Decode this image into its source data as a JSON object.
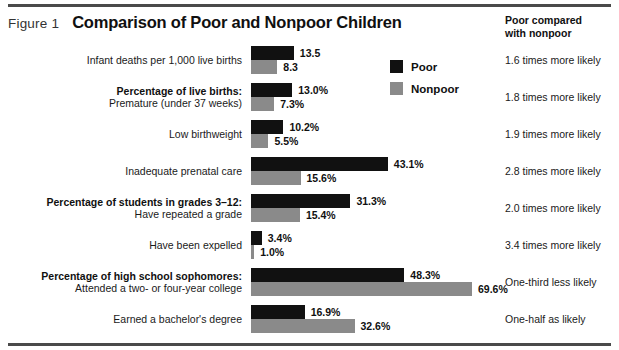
{
  "figure": {
    "number_label": "Figure 1",
    "title": "Comparison of Poor and Nonpoor Children",
    "right_column_header_line1": "Poor compared",
    "right_column_header_line2": "with nonpoor"
  },
  "legend": {
    "items": [
      {
        "label": "Poor",
        "color": "#111111"
      },
      {
        "label": "Nonpoor",
        "color": "#8a8a8a"
      }
    ]
  },
  "chart_data": {
    "type": "bar",
    "title": "Comparison of Poor and Nonpoor Children",
    "xlabel": "",
    "ylabel": "",
    "orientation": "horizontal",
    "grid": false,
    "legend_position": "top-right",
    "xlim": [
      0,
      72
    ],
    "series": [
      {
        "name": "Poor",
        "color": "#111111",
        "values": [
          13.5,
          13.0,
          10.2,
          43.1,
          31.3,
          3.4,
          48.3,
          16.9
        ]
      },
      {
        "name": "Nonpoor",
        "color": "#8a8a8a",
        "values": [
          8.3,
          7.3,
          5.5,
          15.6,
          15.4,
          1.0,
          69.6,
          32.6
        ]
      }
    ],
    "categories": [
      "Infant deaths per 1,000 live births",
      "Premature (under 37 weeks)",
      "Low birthweight",
      "Inadequate prenatal care",
      "Have repeated a grade",
      "Have been expelled",
      "Attended a two- or four-year college",
      "Earned a bachelor's degree"
    ],
    "group_headings": [
      "Percentage of live births:",
      "Percentage of students in grades 3–12:",
      "Percentage of high school sophomores:"
    ],
    "rows": [
      {
        "heading": "",
        "label": "Infant deaths per 1,000 live births",
        "poor_value": 13.5,
        "nonpoor_value": 8.3,
        "poor_label": "13.5",
        "nonpoor_label": "8.3",
        "comparison": "1.6 times more likely"
      },
      {
        "heading": "Percentage of live births:",
        "label": "Premature (under 37 weeks)",
        "poor_value": 13.0,
        "nonpoor_value": 7.3,
        "poor_label": "13.0%",
        "nonpoor_label": "7.3%",
        "comparison": "1.8 times more likely"
      },
      {
        "heading": "",
        "label": "Low birthweight",
        "poor_value": 10.2,
        "nonpoor_value": 5.5,
        "poor_label": "10.2%",
        "nonpoor_label": "5.5%",
        "comparison": "1.9 times more likely"
      },
      {
        "heading": "",
        "label": "Inadequate prenatal care",
        "poor_value": 43.1,
        "nonpoor_value": 15.6,
        "poor_label": "43.1%",
        "nonpoor_label": "15.6%",
        "comparison": "2.8 times more likely"
      },
      {
        "heading": "Percentage of students in grades 3–12:",
        "label": "Have repeated a grade",
        "poor_value": 31.3,
        "nonpoor_value": 15.4,
        "poor_label": "31.3%",
        "nonpoor_label": "15.4%",
        "comparison": "2.0 times more likely"
      },
      {
        "heading": "",
        "label": "Have been expelled",
        "poor_value": 3.4,
        "nonpoor_value": 1.0,
        "poor_label": "3.4%",
        "nonpoor_label": "1.0%",
        "comparison": "3.4 times more likely"
      },
      {
        "heading": "Percentage of high school sophomores:",
        "label": "Attended a two- or four-year college",
        "poor_value": 48.3,
        "nonpoor_value": 69.6,
        "poor_label": "48.3%",
        "nonpoor_label": "69.6%",
        "comparison": "One-third less likely"
      },
      {
        "heading": "",
        "label": "Earned a bachelor's degree",
        "poor_value": 16.9,
        "nonpoor_value": 32.6,
        "poor_label": "16.9%",
        "nonpoor_label": "32.6%",
        "comparison": "One-half as likely"
      }
    ]
  }
}
